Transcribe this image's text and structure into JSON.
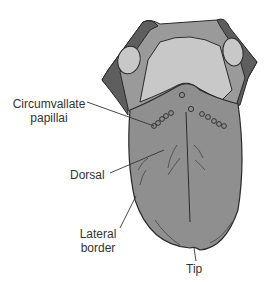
{
  "diagram": {
    "labels": {
      "circumvallate_line1": "Circumvallate",
      "circumvallate_line2": "papillai",
      "dorsal": "Dorsal",
      "lateral_line1": "Lateral",
      "lateral_line2": "border",
      "tip": "Tip"
    },
    "colors": {
      "body": "#8f8f8f",
      "posterior": "#9a9a9a",
      "pale_region": "#c8c8c8",
      "dark_edge": "#5e5e5e",
      "outline": "#2a2a2a",
      "background": "#ffffff"
    }
  }
}
